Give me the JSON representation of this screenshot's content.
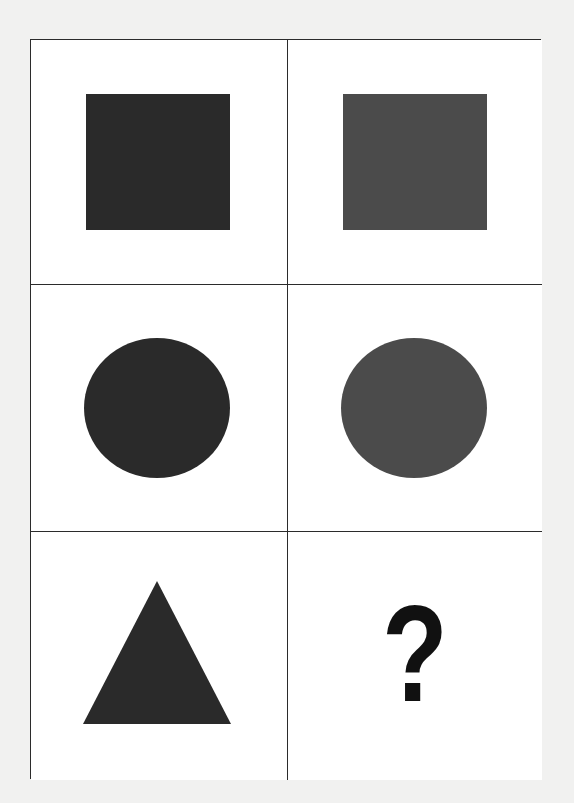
{
  "puzzle": {
    "type": "visual-analogy-matrix",
    "rows": 3,
    "columns": 2,
    "colors": {
      "page_background": "#f1f1f0",
      "cell_background": "#ffffff",
      "border": "#2b2b2b",
      "dark_fill": "#2a2a2a",
      "medium_fill": "#4b4b4b",
      "question_mark": "#111111"
    },
    "cells": [
      {
        "row": 0,
        "col": 0,
        "shape": "square",
        "fill": "dark"
      },
      {
        "row": 0,
        "col": 1,
        "shape": "square",
        "fill": "medium"
      },
      {
        "row": 1,
        "col": 0,
        "shape": "circle",
        "fill": "dark"
      },
      {
        "row": 1,
        "col": 1,
        "shape": "circle",
        "fill": "medium"
      },
      {
        "row": 2,
        "col": 0,
        "shape": "triangle",
        "fill": "dark"
      },
      {
        "row": 2,
        "col": 1,
        "shape": "unknown",
        "label": "?"
      }
    ]
  }
}
